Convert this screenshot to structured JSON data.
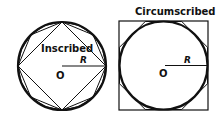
{
  "diagrams": [
    {
      "id": "inscribed",
      "label": "Inscribed",
      "radius_label": "R",
      "center_label": "O",
      "polygons_sides": [
        4,
        8,
        16
      ]
    },
    {
      "id": "circumscribed",
      "label": "Circumscribed",
      "radius_label": "R",
      "center_label": "O",
      "polygons_sides": [
        4,
        8
      ]
    }
  ],
  "colors": {
    "stroke": "#111111",
    "background": "#ffffff"
  }
}
